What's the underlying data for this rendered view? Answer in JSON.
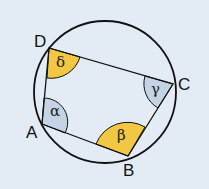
{
  "diagram": {
    "vertices": [
      {
        "label": "A",
        "x": 42,
        "y": 124
      },
      {
        "label": "B",
        "x": 128,
        "y": 156
      },
      {
        "label": "C",
        "x": 173,
        "y": 84
      },
      {
        "label": "D",
        "x": 49,
        "y": 48
      }
    ],
    "angles": [
      {
        "vertex": "A",
        "symbol": "α",
        "color": "#c4d4e4"
      },
      {
        "vertex": "B",
        "symbol": "β",
        "color": "#f2c744"
      },
      {
        "vertex": "C",
        "symbol": "γ",
        "color": "#c4d4e4"
      },
      {
        "vertex": "D",
        "symbol": "δ",
        "color": "#f2c744"
      }
    ],
    "colors": {
      "background": "#e3ecf4",
      "stroke": "#111111",
      "warm": "#f2c744",
      "cool": "#c4d4e4"
    }
  }
}
